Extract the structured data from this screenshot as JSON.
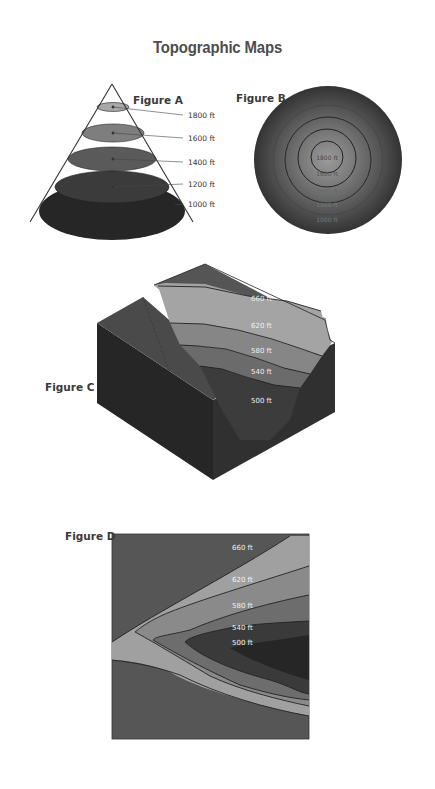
{
  "page": {
    "title": "Topographic Maps"
  },
  "figures": {
    "a": {
      "label": "Figure A",
      "contours": [
        "1800 ft",
        "1600 ft",
        "1400 ft",
        "1200 ft",
        "1000 ft"
      ]
    },
    "b": {
      "label": "Figure B",
      "contours": [
        "1800 ft",
        "1600 ft",
        "1400 ft",
        "1200 ft",
        "1000 ft"
      ]
    },
    "c": {
      "label": "Figure C",
      "contours": [
        "660 ft",
        "620 ft",
        "580 ft",
        "540 ft",
        "500 ft"
      ]
    },
    "d": {
      "label": "Figure D",
      "contours": [
        "660 ft",
        "620 ft",
        "580 ft",
        "540 ft",
        "500 ft"
      ]
    }
  },
  "colors": {
    "title": "#4d4d4d",
    "level_1": "#a6a6a6",
    "level_2": "#8c8c8c",
    "level_3": "#6e6e6e",
    "level_4": "#4e4e4e",
    "level_5": "#2e2e2e",
    "background_dark": "#555555"
  }
}
